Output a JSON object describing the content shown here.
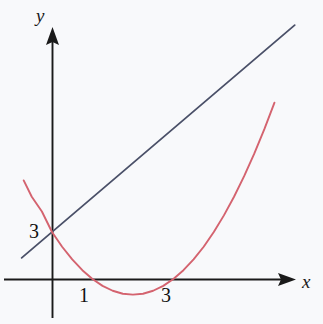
{
  "figure": {
    "background_color": "#f8f9fb",
    "axis_color": "#1a1a1a",
    "parabola_color": "#d4636f",
    "line_color": "#4a5068"
  },
  "axes": {
    "x_label": "x",
    "y_label": "y",
    "x_axis_name": "x-axis",
    "y_axis_name": "y-axis",
    "x_arrow": "arrow-right",
    "y_arrow": "arrow-up"
  },
  "ticks": {
    "y": [
      {
        "label": "3",
        "value": 3
      }
    ],
    "x": [
      {
        "label": "1",
        "value": 1
      },
      {
        "label": "3",
        "value": 3
      }
    ]
  },
  "chart_data": {
    "type": "line",
    "title": "",
    "xlabel": "x",
    "ylabel": "y",
    "grid": false,
    "legend": "none",
    "xlim": [
      -0.7,
      6.0
    ],
    "ylim": [
      -1.6,
      16.0
    ],
    "xticks": [
      1,
      3
    ],
    "yticks": [
      3
    ],
    "series": [
      {
        "name": "parabola",
        "type": "quadratic",
        "color": "#d4636f",
        "equation": "y = (x - 1)(x - 3) = x^2 - 4x + 3",
        "roots": [
          1,
          3
        ],
        "vertex": [
          2,
          -1
        ],
        "y_intercept": 3,
        "x_domain": [
          -0.7,
          5.5
        ],
        "points": [
          [
            -0.7,
            6.29
          ],
          [
            -0.5,
            5.25
          ],
          [
            -0.25,
            4.31
          ],
          [
            0.0,
            3.0
          ],
          [
            0.25,
            2.06
          ],
          [
            0.5,
            1.25
          ],
          [
            0.75,
            0.56
          ],
          [
            1.0,
            0.0
          ],
          [
            1.25,
            -0.44
          ],
          [
            1.5,
            -0.75
          ],
          [
            1.75,
            -0.94
          ],
          [
            2.0,
            -1.0
          ],
          [
            2.25,
            -0.94
          ],
          [
            2.5,
            -0.75
          ],
          [
            2.75,
            -0.44
          ],
          [
            3.0,
            0.0
          ],
          [
            3.25,
            0.56
          ],
          [
            3.5,
            1.25
          ],
          [
            3.75,
            2.06
          ],
          [
            4.0,
            3.0
          ],
          [
            4.25,
            4.06
          ],
          [
            4.5,
            5.25
          ],
          [
            4.75,
            6.56
          ],
          [
            5.0,
            8.0
          ],
          [
            5.25,
            9.56
          ],
          [
            5.5,
            11.25
          ]
        ]
      },
      {
        "name": "straight-line",
        "type": "linear",
        "color": "#4a5068",
        "equation": "y = 2.2x + 3",
        "y_intercept": 3,
        "slope": 2.2,
        "x_domain": [
          -0.75,
          6.0
        ],
        "points": [
          [
            -0.75,
            1.35
          ],
          [
            0.0,
            3.0
          ],
          [
            6.0,
            16.2
          ]
        ]
      }
    ],
    "intersections": [
      {
        "x": 5.5,
        "y": 15.1,
        "description": "line meets parabola upper right"
      },
      {
        "x": 0.0,
        "y": 3.0,
        "description": "both curves cross y-axis at 3"
      }
    ]
  }
}
